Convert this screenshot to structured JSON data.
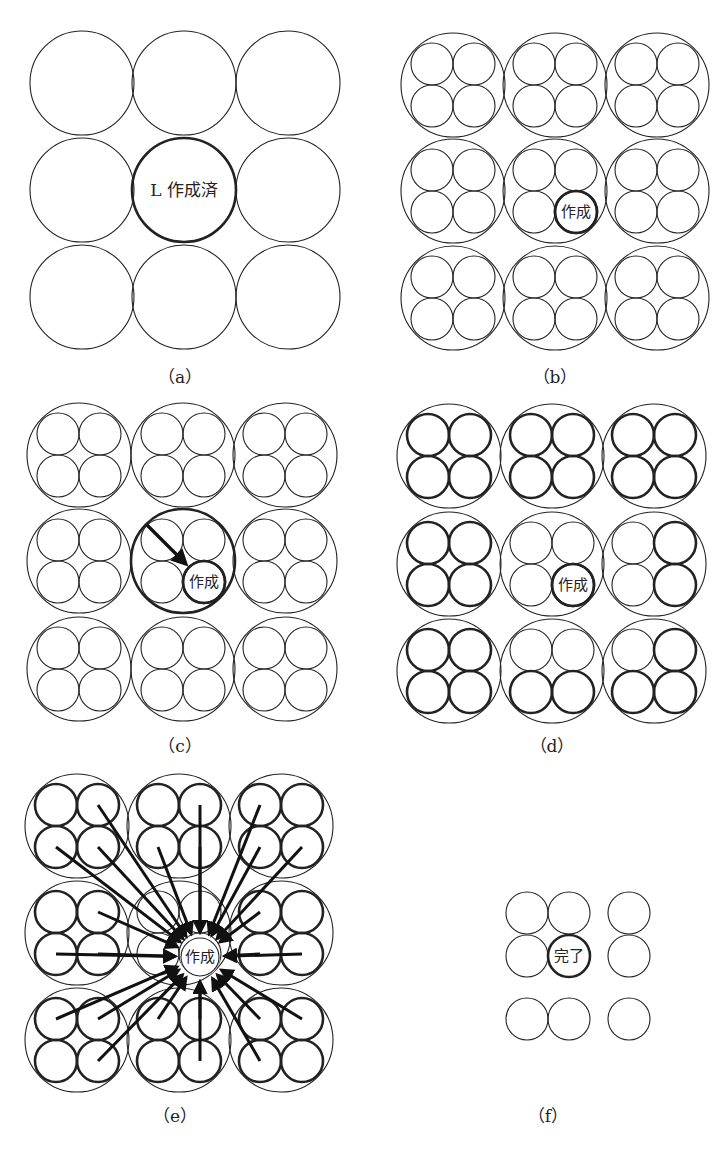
{
  "figure": {
    "colors": {
      "stroke": "#222222",
      "background": "#ffffff"
    },
    "panels": [
      {
        "id": "a",
        "caption": "（a）",
        "caption_pos": [
          180,
          383
        ],
        "description": "3x3 grid of large cells; center cell bold and labelled",
        "cols": [
          82,
          184,
          288
        ],
        "rows": [
          83,
          190,
          297
        ],
        "big_r": 52,
        "has_small": false,
        "bold_big": [
          [
            1,
            1
          ]
        ],
        "center_label": "L 作成済",
        "center_label_size": 17
      },
      {
        "id": "b",
        "caption": "（b）",
        "caption_pos": [
          555,
          383
        ],
        "description": "each large cell subdivided into 4 small cells; one small cell bold",
        "cols": [
          453,
          555,
          657
        ],
        "rows": [
          85,
          191,
          298
        ],
        "big_r": 52,
        "has_small": true,
        "small_r": 21,
        "small_off": 21,
        "bold_small": {
          "1,1": [
            0,
            0,
            0,
            1
          ]
        },
        "small_label": {
          "cell": [
            1,
            1
          ],
          "quad": 3,
          "text": "作成"
        }
      },
      {
        "id": "c",
        "caption": "（c）",
        "caption_pos": [
          180,
          752
        ],
        "description": "parent cell bold with arrow pointing to created child cell",
        "cols": [
          79,
          183,
          285
        ],
        "rows": [
          455,
          561,
          669
        ],
        "big_r": 52,
        "has_small": true,
        "small_r": 21,
        "small_off": 21,
        "bold_big": [
          [
            1,
            1
          ]
        ],
        "bold_small": {
          "1,1": [
            0,
            0,
            0,
            1
          ]
        },
        "small_label": {
          "cell": [
            1,
            1
          ],
          "quad": 3,
          "text": "作成"
        },
        "arrows": [
          {
            "from": [
              147,
              525
            ],
            "to": [
              186,
              564
            ]
          }
        ]
      },
      {
        "id": "d",
        "caption": "（d）",
        "caption_pos": [
          552,
          752
        ],
        "description": "neighbouring small cells shown bold",
        "cols": [
          449,
          552,
          654
        ],
        "rows": [
          456,
          564,
          671
        ],
        "big_r": 52,
        "has_small": true,
        "small_r": 21,
        "small_off": 21,
        "bold_small": {
          "0,0": [
            1,
            1,
            1,
            1
          ],
          "0,1": [
            1,
            1,
            1,
            1
          ],
          "0,2": [
            1,
            1,
            1,
            1
          ],
          "1,0": [
            1,
            1,
            1,
            1
          ],
          "1,1": [
            0,
            0,
            0,
            1
          ],
          "1,2": [
            0,
            1,
            0,
            1
          ],
          "2,0": [
            1,
            1,
            1,
            1
          ],
          "2,1": [
            0,
            0,
            1,
            1
          ],
          "2,2": [
            0,
            1,
            1,
            1
          ]
        },
        "small_label": {
          "cell": [
            1,
            1
          ],
          "quad": 3,
          "text": "作成"
        }
      },
      {
        "id": "e",
        "caption": "（e）",
        "caption_pos": [
          175,
          1122
        ],
        "description": "all neighbouring small cells send arrows to the created cell",
        "cols": [
          77,
          179,
          281
        ],
        "rows": [
          826,
          933,
          1040
        ],
        "big_r": 52,
        "has_small": true,
        "small_r": 21,
        "small_off": 21,
        "all_small_bold_except_center": true,
        "target": {
          "cx": 200,
          "cy": 957,
          "r": 19,
          "text": "作成"
        },
        "radial_arrows": true
      },
      {
        "id": "f",
        "caption": "（f）",
        "caption_pos": [
          548,
          1122
        ],
        "description": "resulting set of small cells; created cell marked complete",
        "circles": [
          {
            "cx": 527,
            "cy": 913,
            "r": 21,
            "bold": false
          },
          {
            "cx": 569,
            "cy": 913,
            "r": 21,
            "bold": false
          },
          {
            "cx": 629,
            "cy": 913,
            "r": 21,
            "bold": false
          },
          {
            "cx": 527,
            "cy": 956,
            "r": 21,
            "bold": false
          },
          {
            "cx": 569,
            "cy": 956,
            "r": 21,
            "bold": true,
            "text": "完了"
          },
          {
            "cx": 629,
            "cy": 956,
            "r": 21,
            "bold": false
          },
          {
            "cx": 527,
            "cy": 1019,
            "r": 21,
            "bold": false
          },
          {
            "cx": 569,
            "cy": 1019,
            "r": 21,
            "bold": false
          },
          {
            "cx": 629,
            "cy": 1019,
            "r": 21,
            "bold": false
          }
        ]
      }
    ]
  }
}
